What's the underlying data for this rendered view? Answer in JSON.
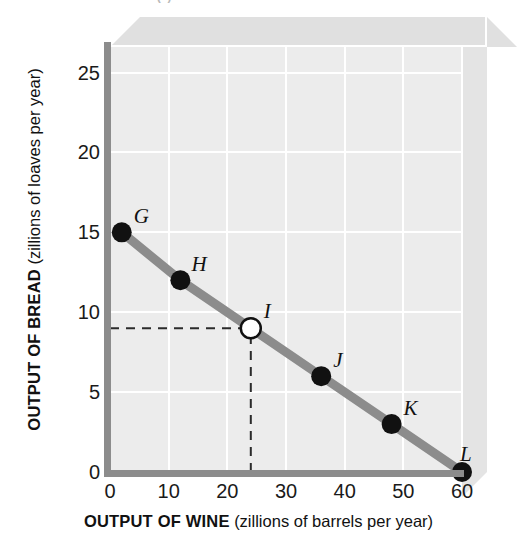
{
  "figure": {
    "cut_title": "(a) Production Possibilities Frontier"
  },
  "chart_data": {
    "type": "line",
    "title": "",
    "xlabel_bold": "OUTPUT OF WINE",
    "xlabel_normal": "(zillions of barrels per year)",
    "ylabel_bold": "OUTPUT OF BREAD",
    "ylabel_normal": "(zillions of loaves per year)",
    "xlim": [
      0,
      60
    ],
    "ylim": [
      0,
      26.6
    ],
    "xticks": [
      0,
      10,
      20,
      30,
      40,
      50,
      60
    ],
    "xtick_labels": [
      "0",
      "10",
      "20",
      "30",
      "40",
      "50",
      "60"
    ],
    "yticks": [
      0,
      5,
      10,
      15,
      20,
      25
    ],
    "ytick_labels": [
      "0",
      "5",
      "10",
      "15",
      "20",
      "25"
    ],
    "grid": true,
    "legend": "none",
    "series": [
      {
        "name": "Production possibilities frontier",
        "color": "#8c8c8c",
        "x": [
          2,
          12,
          24,
          36,
          48,
          60
        ],
        "y": [
          15,
          12,
          9,
          6,
          3,
          0
        ]
      }
    ],
    "points": [
      {
        "label": "G",
        "x": 2,
        "y": 15,
        "filled": true,
        "lx": 12,
        "ly": -26
      },
      {
        "label": "H",
        "x": 12,
        "y": 12,
        "filled": true,
        "lx": 11,
        "ly": -26
      },
      {
        "label": "I",
        "x": 24,
        "y": 9,
        "filled": false,
        "lx": 13,
        "ly": -27
      },
      {
        "label": "J",
        "x": 36,
        "y": 6,
        "filled": true,
        "lx": 12,
        "ly": -26
      },
      {
        "label": "K",
        "x": 48,
        "y": 3,
        "filled": true,
        "lx": 12,
        "ly": -26
      },
      {
        "label": "L",
        "x": 60,
        "y": 0,
        "filled": true,
        "lx": -2,
        "ly": -28
      }
    ],
    "guidelines": [
      {
        "orientation": "horizontal",
        "from_x": 0,
        "to_x": 24,
        "y": 9,
        "style": "dashed"
      },
      {
        "orientation": "vertical",
        "x": 24,
        "from_y": 0,
        "to_y": 9,
        "style": "dashed"
      }
    ],
    "annotations": []
  },
  "style": {
    "plot_bg": "#ececec",
    "gridline_color": "#ffffff",
    "axis_color": "#8c8c8c",
    "series_color": "#8c8c8c",
    "point_fill": "#111111",
    "point_open_fill": "#ffffff",
    "box3d_top": "#e0e0e0",
    "box3d_side": "#e4e4e4"
  }
}
